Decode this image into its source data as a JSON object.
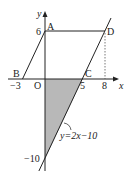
{
  "figure": {
    "type": "coordinate-geometry",
    "background": "#ffffff",
    "stroke_color": "#222222",
    "shade_color": "#b8b8b8",
    "axes": {
      "x_label": "x",
      "y_label": "y",
      "origin_label": "O"
    },
    "ticks": {
      "x": [
        "−3",
        "5",
        "8"
      ],
      "y": [
        "6",
        "−10"
      ]
    },
    "points": {
      "A": {
        "label": "A",
        "coords": [
          0,
          6
        ]
      },
      "B": {
        "label": "B",
        "coords": [
          -3,
          0
        ]
      },
      "C": {
        "label": "C",
        "coords": [
          5,
          0
        ]
      },
      "D": {
        "label": "D",
        "coords": [
          8,
          6
        ]
      }
    },
    "line_equation": "y=2x−10",
    "shaded_region": "triangle O, C(5,0), (0,−10)"
  }
}
